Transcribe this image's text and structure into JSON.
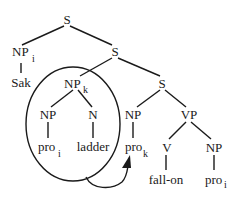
{
  "diagram": {
    "type": "syntax-tree",
    "nodes": {
      "s_root": {
        "label": "S",
        "sub": ""
      },
      "np_i": {
        "label": "NP",
        "sub": "i"
      },
      "sak": {
        "label": "Sak",
        "sub": ""
      },
      "s_2": {
        "label": "S",
        "sub": ""
      },
      "np_k": {
        "label": "NP",
        "sub": "k"
      },
      "s_3": {
        "label": "S",
        "sub": ""
      },
      "np_inner": {
        "label": "NP",
        "sub": ""
      },
      "pro_i_1": {
        "label": "pro",
        "sub": "i"
      },
      "n": {
        "label": "N",
        "sub": ""
      },
      "ladder": {
        "label": "ladder",
        "sub": ""
      },
      "np_mid": {
        "label": "NP",
        "sub": ""
      },
      "pro_k": {
        "label": "pro",
        "sub": "k"
      },
      "vp": {
        "label": "VP",
        "sub": ""
      },
      "v": {
        "label": "V",
        "sub": ""
      },
      "fall_on": {
        "label": "fall-on",
        "sub": ""
      },
      "np_right": {
        "label": "NP",
        "sub": ""
      },
      "pro_i_2": {
        "label": "pro",
        "sub": "i"
      }
    },
    "edges": [
      [
        "s_root",
        "np_i"
      ],
      [
        "s_root",
        "s_2"
      ],
      [
        "np_i",
        "sak"
      ],
      [
        "s_2",
        "np_k"
      ],
      [
        "s_2",
        "s_3"
      ],
      [
        "np_k",
        "np_inner"
      ],
      [
        "np_k",
        "n"
      ],
      [
        "np_inner",
        "pro_i_1"
      ],
      [
        "n",
        "ladder"
      ],
      [
        "s_3",
        "np_mid"
      ],
      [
        "s_3",
        "vp"
      ],
      [
        "np_mid",
        "pro_k"
      ],
      [
        "vp",
        "v"
      ],
      [
        "vp",
        "np_right"
      ],
      [
        "v",
        "fall_on"
      ],
      [
        "np_right",
        "pro_i_2"
      ]
    ],
    "annotations": {
      "ellipse": "circles NP_k subtree (pro_i ladder)",
      "arrow": "from circled NP_k to pro_k"
    }
  }
}
